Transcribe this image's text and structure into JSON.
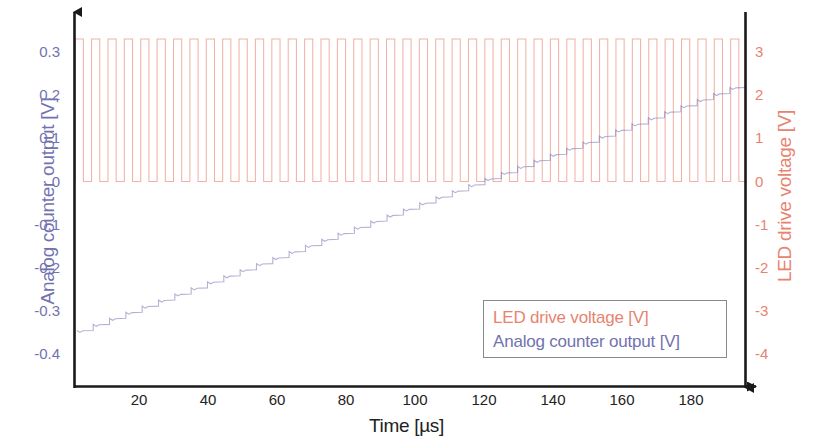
{
  "chart_data": {
    "type": "line",
    "title": "",
    "xlabel": "Time [µs]",
    "xticks": [
      20,
      40,
      60,
      80,
      100,
      120,
      140,
      160,
      180
    ],
    "xlim": [
      0,
      196
    ],
    "grid": false,
    "legend_position": "inner lower right",
    "axes": {
      "left": {
        "label": "Analog counter output [V]",
        "color": "#7272b0",
        "ticks": [
          0.3,
          0.2,
          0.1,
          0,
          -0.1,
          -0.2,
          -0.3,
          -0.4
        ],
        "tick_labels": [
          "0.3",
          "0.2",
          "0.1",
          "0",
          "-0.1",
          "-0.2",
          "-0.3",
          "-0.4"
        ],
        "ylim": [
          -0.47,
          0.345
        ]
      },
      "right": {
        "label": "LED drive voltage [V]",
        "color": "#e8836f",
        "ticks": [
          3,
          2,
          1,
          0,
          -1,
          -2,
          -3,
          -4
        ],
        "tick_labels": [
          "3",
          "2",
          "1",
          "0",
          "-1",
          "-2",
          "-3",
          "-4"
        ],
        "ylim": [
          -4.7,
          3.45
        ]
      }
    },
    "series": [
      {
        "name": "LED drive voltage [V]",
        "color": "#e8836f",
        "axis": "right",
        "type": "square-pulse-train",
        "low_value": 0,
        "high_value": 3.3,
        "period_us": 4.75,
        "duty_cycle": 0.5,
        "pulse_count": 41,
        "start_us": 1.5
      },
      {
        "name": "Analog counter output [V]",
        "color": "#7272b0",
        "axis": "left",
        "type": "staircase-ramp",
        "start_value": -0.345,
        "end_value": 0.232,
        "step_count": 41,
        "step_size": 0.0141,
        "start_us": 2,
        "end_us": 196
      }
    ]
  },
  "legend": {
    "entries": [
      {
        "label": "LED drive voltage [V]",
        "color": "#e8836f"
      },
      {
        "label": "Analog counter output [V]",
        "color": "#7272b0"
      }
    ]
  }
}
